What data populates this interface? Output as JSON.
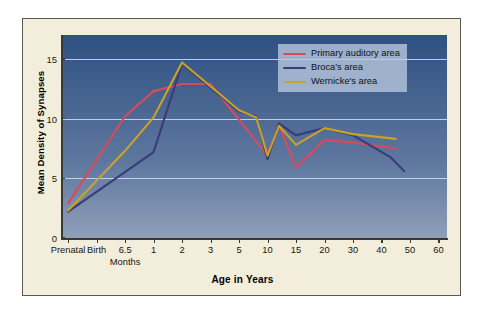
{
  "chart_data": {
    "type": "line",
    "title": "",
    "xlabel": "Age in Years",
    "ylabel": "Mean Density of Synapses",
    "x_sublabel": "Months",
    "x_sublabel_at": "6.5",
    "categories": [
      "Prenatal",
      "Birth",
      "6.5",
      "1",
      "2",
      "3",
      "5",
      "10",
      "15",
      "20",
      "30",
      "40",
      "50",
      "60"
    ],
    "ylim": [
      0,
      17
    ],
    "yticks": [
      0,
      5,
      10,
      15
    ],
    "grid": true,
    "legend_position": "top-right",
    "series": [
      {
        "name": "Primary auditory area",
        "color": "#d94a5a",
        "points": [
          {
            "x": "Prenatal",
            "y": 2.9
          },
          {
            "x": "6.5",
            "y": 10.2
          },
          {
            "x": "1",
            "y": 12.3
          },
          {
            "x": "2",
            "y": 12.9
          },
          {
            "x": "3",
            "y": 12.9
          },
          {
            "x": "10",
            "y": 6.9
          },
          {
            "x": "12",
            "y": 9.5
          },
          {
            "x": "15",
            "y": 5.9
          },
          {
            "x": "20",
            "y": 8.2
          },
          {
            "x": "30",
            "y": 8.0
          },
          {
            "x": "45",
            "y": 7.5
          }
        ]
      },
      {
        "name": "Broca's area",
        "color": "#3b3a7a",
        "points": [
          {
            "x": "Prenatal",
            "y": 2.2
          },
          {
            "x": "1",
            "y": 7.2
          },
          {
            "x": "2",
            "y": 14.6
          },
          {
            "x": "5",
            "y": 10.6
          },
          {
            "x": "8",
            "y": 10.2
          },
          {
            "x": "10",
            "y": 6.6
          },
          {
            "x": "12",
            "y": 9.6
          },
          {
            "x": "15",
            "y": 8.6
          },
          {
            "x": "20",
            "y": 9.2
          },
          {
            "x": "30",
            "y": 8.6
          },
          {
            "x": "43",
            "y": 6.8
          },
          {
            "x": "48",
            "y": 5.6
          }
        ]
      },
      {
        "name": "Wernicke's area",
        "color": "#c9a227",
        "points": [
          {
            "x": "Prenatal",
            "y": 2.3
          },
          {
            "x": "6.5",
            "y": 7.3
          },
          {
            "x": "1",
            "y": 10.1
          },
          {
            "x": "2",
            "y": 14.7
          },
          {
            "x": "5",
            "y": 10.7
          },
          {
            "x": "8",
            "y": 10.1
          },
          {
            "x": "10",
            "y": 6.9
          },
          {
            "x": "12",
            "y": 9.4
          },
          {
            "x": "15",
            "y": 7.8
          },
          {
            "x": "20",
            "y": 9.2
          },
          {
            "x": "30",
            "y": 8.7
          },
          {
            "x": "45",
            "y": 8.3
          }
        ]
      }
    ]
  },
  "axes": {
    "y_title": "Mean Density of Synapses",
    "x_title": "Age in Years",
    "months_label": "Months",
    "y_tick_labels": [
      "0",
      "5",
      "10",
      "15"
    ],
    "x_tick_labels": [
      "Prenatal",
      "Birth",
      "6.5",
      "1",
      "2",
      "3",
      "5",
      "10",
      "15",
      "20",
      "30",
      "40",
      "50",
      "60"
    ]
  },
  "legend": {
    "items": [
      {
        "label": "Primary auditory area",
        "color": "#d94a5a"
      },
      {
        "label": "Broca's area",
        "color": "#3b3a7a"
      },
      {
        "label": "Wernicke's area",
        "color": "#c9a227"
      }
    ]
  },
  "colors": {
    "panel_background": "#f3eedb",
    "plot_top": "#2e5182",
    "plot_bottom": "#8f9fb8",
    "gridline": "#d8e2ee",
    "axis": "#3a3a34"
  }
}
